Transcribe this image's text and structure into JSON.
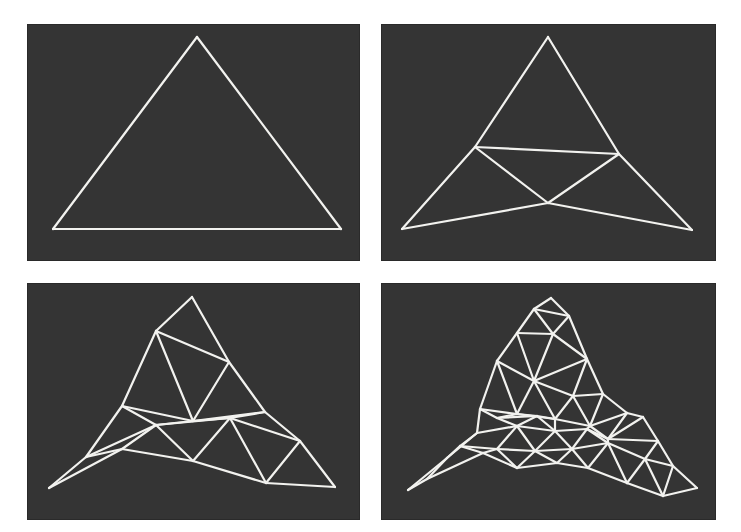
{
  "figure": {
    "background_color": "#343434",
    "line_color": "#f2f2ef",
    "panels": [
      {
        "id": "stage-1",
        "label": "Initial triangle",
        "vertices": [
          [
            170,
            13
          ],
          [
            26,
            205
          ],
          [
            314,
            205
          ]
        ],
        "edges": [
          [
            0,
            1
          ],
          [
            1,
            2
          ],
          [
            2,
            0
          ]
        ]
      },
      {
        "id": "stage-2",
        "label": "First subdivision",
        "vertices": [
          [
            167,
            13
          ],
          [
            94,
            123
          ],
          [
            238,
            130
          ],
          [
            167,
            179
          ],
          [
            21,
            205
          ],
          [
            311,
            206
          ]
        ],
        "edges": [
          [
            0,
            1
          ],
          [
            0,
            2
          ],
          [
            1,
            2
          ],
          [
            1,
            3
          ],
          [
            2,
            3
          ],
          [
            1,
            4
          ],
          [
            4,
            3
          ],
          [
            3,
            5
          ],
          [
            2,
            5
          ]
        ]
      },
      {
        "id": "stage-3",
        "label": "Second subdivision",
        "vertices": [
          [
            165,
            14
          ],
          [
            129,
            48
          ],
          [
            202,
            79
          ],
          [
            95,
            123
          ],
          [
            166,
            138
          ],
          [
            238,
            129
          ],
          [
            129,
            142
          ],
          [
            203,
            135
          ],
          [
            273,
            158
          ],
          [
            59,
            174
          ],
          [
            95,
            166
          ],
          [
            166,
            178
          ],
          [
            239,
            200
          ],
          [
            22,
            205
          ],
          [
            308,
            204
          ]
        ],
        "edges": [
          [
            0,
            1
          ],
          [
            0,
            2
          ],
          [
            1,
            2
          ],
          [
            1,
            3
          ],
          [
            1,
            4
          ],
          [
            2,
            4
          ],
          [
            2,
            5
          ],
          [
            3,
            4
          ],
          [
            4,
            5
          ],
          [
            3,
            6
          ],
          [
            3,
            9
          ],
          [
            4,
            6
          ],
          [
            6,
            7
          ],
          [
            7,
            5
          ],
          [
            5,
            8
          ],
          [
            7,
            8
          ],
          [
            4,
            7
          ],
          [
            6,
            9
          ],
          [
            6,
            10
          ],
          [
            9,
            10
          ],
          [
            9,
            13
          ],
          [
            10,
            13
          ],
          [
            6,
            11
          ],
          [
            10,
            11
          ],
          [
            7,
            11
          ],
          [
            7,
            12
          ],
          [
            11,
            12
          ],
          [
            8,
            12
          ],
          [
            8,
            14
          ],
          [
            12,
            14
          ]
        ]
      },
      {
        "id": "stage-4",
        "label": "Third subdivision",
        "vertices": [
          [
            170,
            15
          ],
          [
            153,
            26
          ],
          [
            188,
            33
          ],
          [
            136,
            50
          ],
          [
            172,
            51
          ],
          [
            116,
            78
          ],
          [
            206,
            76
          ],
          [
            153,
            98
          ],
          [
            192,
            113
          ],
          [
            222,
            111
          ],
          [
            99,
            126
          ],
          [
            136,
            131
          ],
          [
            174,
            136
          ],
          [
            209,
            143
          ],
          [
            246,
            130
          ],
          [
            262,
            134
          ],
          [
            116,
            135
          ],
          [
            156,
            133
          ],
          [
            96,
            150
          ],
          [
            136,
            143
          ],
          [
            174,
            148
          ],
          [
            206,
            146
          ],
          [
            227,
            156
          ],
          [
            277,
            158
          ],
          [
            66,
            175
          ],
          [
            79,
            163
          ],
          [
            116,
            166
          ],
          [
            154,
            168
          ],
          [
            191,
            166
          ],
          [
            227,
            160
          ],
          [
            264,
            176
          ],
          [
            292,
            183
          ],
          [
            46,
            196
          ],
          [
            102,
            170
          ],
          [
            136,
            185
          ],
          [
            176,
            180
          ],
          [
            207,
            185
          ],
          [
            246,
            200
          ],
          [
            282,
            213
          ],
          [
            316,
            205
          ],
          [
            27,
            207
          ]
        ],
        "edges": [
          [
            0,
            1
          ],
          [
            0,
            2
          ],
          [
            1,
            2
          ],
          [
            1,
            3
          ],
          [
            1,
            4
          ],
          [
            2,
            4
          ],
          [
            2,
            6
          ],
          [
            3,
            4
          ],
          [
            3,
            5
          ],
          [
            3,
            7
          ],
          [
            4,
            7
          ],
          [
            4,
            6
          ],
          [
            5,
            7
          ],
          [
            6,
            7
          ],
          [
            6,
            8
          ],
          [
            6,
            9
          ],
          [
            7,
            8
          ],
          [
            5,
            10
          ],
          [
            5,
            11
          ],
          [
            7,
            11
          ],
          [
            7,
            12
          ],
          [
            8,
            12
          ],
          [
            8,
            13
          ],
          [
            8,
            9
          ],
          [
            9,
            13
          ],
          [
            9,
            14
          ],
          [
            14,
            15
          ],
          [
            13,
            14
          ],
          [
            10,
            11
          ],
          [
            11,
            12
          ],
          [
            12,
            13
          ],
          [
            10,
            16
          ],
          [
            11,
            16
          ],
          [
            11,
            17
          ],
          [
            12,
            17
          ],
          [
            12,
            20
          ],
          [
            13,
            21
          ],
          [
            13,
            22
          ],
          [
            14,
            22
          ],
          [
            15,
            22
          ],
          [
            15,
            23
          ],
          [
            16,
            17
          ],
          [
            10,
            18
          ],
          [
            16,
            19
          ],
          [
            17,
            19
          ],
          [
            17,
            20
          ],
          [
            18,
            19
          ],
          [
            19,
            20
          ],
          [
            20,
            21
          ],
          [
            21,
            22
          ],
          [
            22,
            23
          ],
          [
            21,
            29
          ],
          [
            22,
            29
          ],
          [
            23,
            30
          ],
          [
            23,
            31
          ],
          [
            18,
            25
          ],
          [
            18,
            24
          ],
          [
            19,
            26
          ],
          [
            19,
            27
          ],
          [
            20,
            27
          ],
          [
            20,
            28
          ],
          [
            21,
            28
          ],
          [
            24,
            25
          ],
          [
            25,
            26
          ],
          [
            26,
            27
          ],
          [
            27,
            28
          ],
          [
            28,
            29
          ],
          [
            29,
            30
          ],
          [
            30,
            31
          ],
          [
            24,
            32
          ],
          [
            25,
            33
          ],
          [
            26,
            33
          ],
          [
            26,
            34
          ],
          [
            27,
            34
          ],
          [
            27,
            35
          ],
          [
            28,
            35
          ],
          [
            28,
            36
          ],
          [
            29,
            36
          ],
          [
            29,
            37
          ],
          [
            30,
            37
          ],
          [
            30,
            38
          ],
          [
            31,
            38
          ],
          [
            31,
            39
          ],
          [
            32,
            33
          ],
          [
            33,
            34
          ],
          [
            34,
            35
          ],
          [
            35,
            36
          ],
          [
            36,
            37
          ],
          [
            37,
            38
          ],
          [
            38,
            39
          ],
          [
            32,
            40
          ],
          [
            24,
            40
          ]
        ]
      }
    ]
  }
}
